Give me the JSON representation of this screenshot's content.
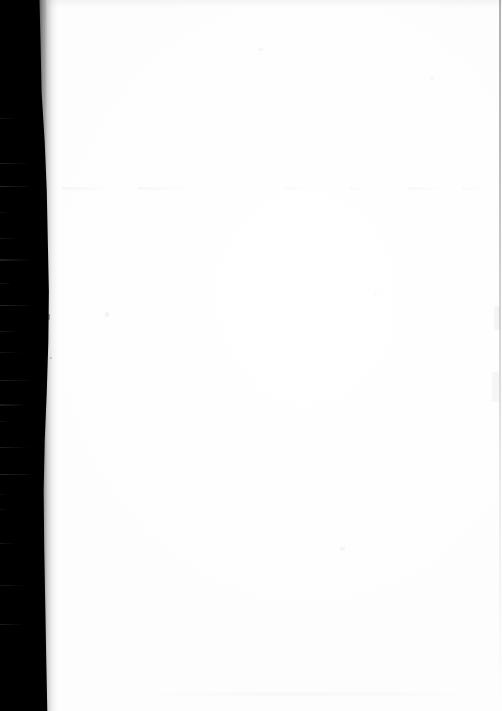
{
  "document": {
    "kind": "scanned-page",
    "page_state": "blank",
    "caption": "",
    "width_px": 502,
    "height_px": 711
  },
  "colors": {
    "paper": "#ffffff",
    "gutter_shadow": "#000000",
    "ghost_text": "#f4f4f4",
    "right_rule": "#d8d8d8",
    "speck": "#cfcfcf"
  },
  "regions": {
    "gutter": {
      "name": "binding-gutter-shadow",
      "side": "left",
      "min_width_px": 38,
      "max_width_px": 50
    },
    "content_area": {
      "name": "blank-paper-field",
      "text": ""
    },
    "right_rule": {
      "name": "right-edge-rule",
      "x_px": 499
    }
  },
  "artifacts": {
    "ghost_text_line": {
      "label": "",
      "y_px": 188
    },
    "top_smudge": {
      "label": "",
      "y_px": 0
    },
    "specks": [
      {
        "label": "",
        "x_px": 50,
        "y_px": 357
      },
      {
        "label": "",
        "x_px": 105,
        "y_px": 312
      },
      {
        "label": "",
        "x_px": 340,
        "y_px": 547
      },
      {
        "label": "",
        "x_px": 430,
        "y_px": 76
      },
      {
        "label": "",
        "x_px": 258,
        "y_px": 48
      },
      {
        "label": "",
        "x_px": 374,
        "y_px": 292
      }
    ]
  }
}
